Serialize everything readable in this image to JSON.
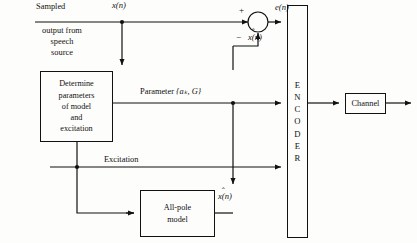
{
  "diagram": {
    "line_color": "#111111",
    "background": "#fdfdfb"
  },
  "labels": {
    "sampled": "Sampled",
    "source": "output from speech source",
    "input_signal": "x(n)",
    "parameter": "Parameter",
    "parameter_set": "{aₖ, G}",
    "excitation": "Excitation",
    "error_signal": "e(n)",
    "plus_sign": "+",
    "minus_sign": "−",
    "xhat_top": "x(n)",
    "xhat_bottom": "x(n)",
    "hat_mark": "ˆ"
  },
  "blocks": {
    "determine": {
      "name": "determine-parameters-block",
      "lines": [
        "Determine",
        "parameters",
        "of model",
        "and",
        "excitation"
      ]
    },
    "allpole": {
      "name": "all-pole-model-block",
      "lines": [
        "All-pole",
        "model"
      ]
    },
    "encoder": {
      "name": "encoder-block",
      "letters": [
        "E",
        "N",
        "C",
        "O",
        "D",
        "E",
        "R"
      ]
    },
    "channel": {
      "name": "channel-block",
      "label": "Channel"
    }
  }
}
